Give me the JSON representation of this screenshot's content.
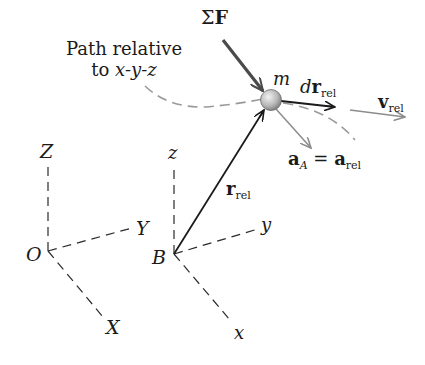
{
  "figure": {
    "path_label_line1": "Path relative",
    "path_label_line2_prefix": "to ",
    "path_label_line2_axes": "x-y-z",
    "mass_label": "m",
    "force_label": {
      "symbol": "Σ",
      "vector": "F"
    },
    "dr_label": {
      "d": "d",
      "vector": "r",
      "sub": "rel"
    },
    "v_label": {
      "vector": "v",
      "sub": "rel"
    },
    "a_label": {
      "vector_a": "a",
      "sub_a": "A",
      "equals": " = ",
      "vector_b": "a",
      "sub_b": "rel"
    },
    "r_label": {
      "vector": "r",
      "sub": "rel"
    },
    "fixed_frame": {
      "origin": "O",
      "x": "X",
      "y": "Y",
      "z": "Z"
    },
    "moving_frame": {
      "origin": "B",
      "x": "x",
      "y": "y",
      "z": "z"
    }
  },
  "colors": {
    "ink": "#1a1a1a",
    "gray_path": "#9a9a9a",
    "gray_arrow": "#8c8c8c",
    "force": "#4a4a4a",
    "particle_light": "#e6e6e6",
    "particle_dark": "#8a8a8a"
  }
}
